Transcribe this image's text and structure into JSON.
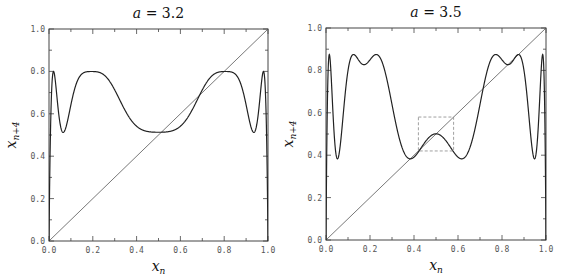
{
  "chart_data": [
    {
      "type": "line",
      "title": "a = 3.2",
      "title_parts": {
        "var": "a",
        "value": "3.2"
      },
      "xlabel": "x_n",
      "ylabel": "x_{n+4}",
      "xlim": [
        0.0,
        1.0
      ],
      "ylim": [
        0.0,
        1.0
      ],
      "xticks": [
        "0.0",
        "0.2",
        "0.4",
        "0.6",
        "0.8",
        "1.0"
      ],
      "yticks": [
        "0.0",
        "0.2",
        "0.4",
        "0.6",
        "0.8",
        "1.0"
      ],
      "grid": false,
      "legend": null,
      "series": [
        {
          "name": "fourth iterate of logistic map",
          "function": "f^4(x), f(x)=a*x*(1-x)",
          "a": 3.2,
          "key_points": {
            "max": 0.8,
            "local_min_near_0.07": 0.513,
            "min_at_0.5": 0.513
          }
        },
        {
          "name": "diagonal",
          "function": "y = x",
          "x": [
            0,
            1
          ],
          "y": [
            0,
            1
          ]
        }
      ]
    },
    {
      "type": "line",
      "title": "a = 3.5",
      "title_parts": {
        "var": "a",
        "value": "3.5"
      },
      "xlabel": "x_n",
      "ylabel": "x_{n+4}",
      "xlim": [
        0.0,
        1.0
      ],
      "ylim": [
        0.0,
        1.0
      ],
      "xticks": [
        "0.0",
        "0.2",
        "0.4",
        "0.6",
        "0.8",
        "1.0"
      ],
      "yticks": [
        "0.0",
        "0.2",
        "0.4",
        "0.6",
        "0.8",
        "1.0"
      ],
      "grid": false,
      "legend": null,
      "series": [
        {
          "name": "fourth iterate of logistic map",
          "function": "f^4(x), f(x)=a*x*(1-x)",
          "a": 3.5,
          "key_points": {
            "max": 0.875,
            "local_min": 0.383,
            "value_at_0.5": 0.501
          }
        },
        {
          "name": "diagonal",
          "function": "y = x",
          "x": [
            0,
            1
          ],
          "y": [
            0,
            1
          ]
        }
      ],
      "annotations": [
        {
          "type": "dashed-box",
          "x": [
            0.42,
            0.58
          ],
          "y": [
            0.42,
            0.58
          ]
        }
      ]
    }
  ]
}
